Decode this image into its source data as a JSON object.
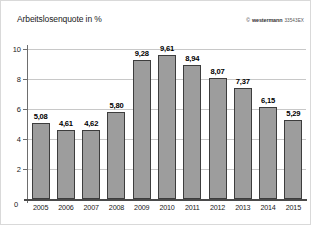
{
  "chart_data": {
    "type": "bar",
    "title": "Arbeitslosenquote in %",
    "xlabel": "",
    "ylabel": "Arbeitslosenquote in %",
    "categories": [
      "2005",
      "2006",
      "2007",
      "2008",
      "2009",
      "2010",
      "2011",
      "2012",
      "2013",
      "2014",
      "2015"
    ],
    "values": [
      5.08,
      4.61,
      4.62,
      5.8,
      9.28,
      9.61,
      8.94,
      8.07,
      7.37,
      6.15,
      5.29
    ],
    "value_labels": [
      "5,08",
      "4,61",
      "4,62",
      "5,80",
      "9,28",
      "9,61",
      "8,94",
      "8,07",
      "7,37",
      "6,15",
      "5,29"
    ],
    "ylim": [
      0,
      10
    ],
    "yticks": [
      0,
      2,
      4,
      6,
      8,
      10
    ],
    "ytick_labels": [
      "0",
      "2",
      "4",
      "6",
      "8",
      "10"
    ],
    "grid": true,
    "legend": "none",
    "bar_color": "#9d9d9d",
    "bar_edge_color": "#3d3d3d",
    "grid_color": "#c8c8c8",
    "axis_color": "#4a4a4a"
  },
  "credit": {
    "mark": "©",
    "brand": "westermann",
    "code": "33543EX"
  }
}
